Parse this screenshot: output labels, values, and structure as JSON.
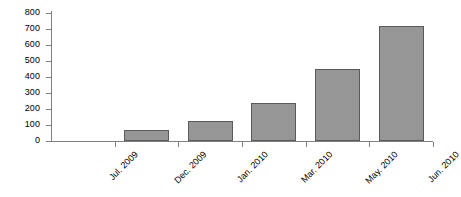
{
  "chart_data": {
    "type": "bar",
    "title": "",
    "subtitle": "",
    "xlabel": "",
    "ylabel": "",
    "categories": [
      "Jul. 2009",
      "Dec. 2009",
      "Jan. 2010",
      "Mar. 2010",
      "May. 2010",
      "Jun. 2010"
    ],
    "values": [
      0,
      70,
      125,
      235,
      450,
      720
    ],
    "series": [
      {
        "name": "",
        "values": [
          0,
          70,
          125,
          235,
          450,
          720
        ]
      }
    ],
    "ylim": [
      0,
      800
    ],
    "yticks": [
      0,
      100,
      200,
      300,
      400,
      500,
      600,
      700,
      800
    ],
    "ytick_labels": [
      "0",
      "100",
      "200",
      "300",
      "400",
      "500",
      "600",
      "700",
      "800"
    ],
    "grid": false,
    "legend": false,
    "legend_position": "none",
    "bar_color": "#969696",
    "bar_edge_color": "#5a5a5a",
    "axis_color": "#808080",
    "text_color": "#000000",
    "background_color": "#ffffff",
    "xlabel_rotation": 45
  }
}
